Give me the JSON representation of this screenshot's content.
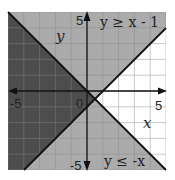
{
  "chart_data": {
    "type": "region",
    "title": "",
    "xlabel": "x",
    "ylabel": "y",
    "xlim": [
      -5,
      5
    ],
    "ylim": [
      -5,
      5
    ],
    "grid": true,
    "grid_step": 1,
    "tick_labels": {
      "x": [
        {
          "value": -5,
          "label": "-5"
        },
        {
          "value": 0,
          "label": "0"
        },
        {
          "value": 5,
          "label": "5"
        }
      ],
      "y": [
        {
          "value": 5,
          "label": "5"
        },
        {
          "value": -5,
          "label": "-5"
        }
      ]
    },
    "series": [
      {
        "name": "y ≥ x - 1",
        "boundary": "y = x - 1",
        "slope": 1,
        "intercept": -1,
        "shade": "above"
      },
      {
        "name": "y ≤ -x",
        "boundary": "y = -x",
        "slope": -1,
        "intercept": 0,
        "shade": "below"
      }
    ],
    "intersection": {
      "x": 0.5,
      "y": -0.5
    },
    "colors": {
      "overlap": "#4d4d4d",
      "single": "#ababab",
      "none": "#ffffff",
      "grid_dark": "#2e2e2e",
      "grid_light": "#979797",
      "grid_white": "#dddddd",
      "line": "#111111"
    }
  },
  "labels": {
    "ineq1": "y ≥ x - 1",
    "ineq2": "y ≤ -x",
    "x_axis": "x",
    "y_axis": "y",
    "x_min": "-5",
    "x_max": "5",
    "y_max": "5",
    "y_min": "-5",
    "origin": "0"
  }
}
